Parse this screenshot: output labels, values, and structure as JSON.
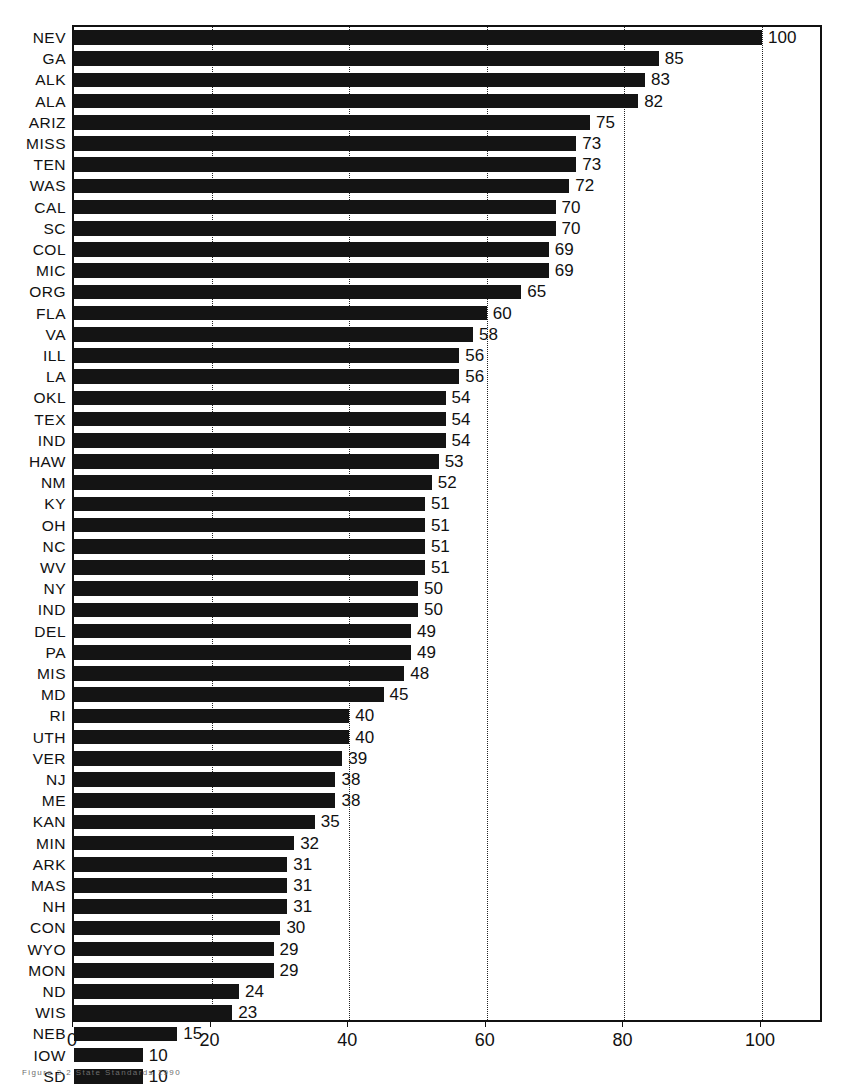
{
  "chart_data": {
    "type": "bar",
    "orientation": "horizontal",
    "title": "",
    "subtitle": "",
    "xlabel": "",
    "ylabel": "",
    "xlim": [
      0,
      110
    ],
    "xticks": [
      0,
      20,
      40,
      60,
      80,
      100
    ],
    "xtick_labels": [
      "0",
      "20",
      "40",
      "60",
      "80",
      "100"
    ],
    "gridlines": [
      20,
      40,
      60,
      80,
      100
    ],
    "grid": true,
    "grid_style": "dotted",
    "legend": null,
    "bar_color": "#141414",
    "categories": [
      "NEV",
      "GA",
      "ALK",
      "ALA",
      "ARIZ",
      "MISS",
      "TEN",
      "WAS",
      "CAL",
      "SC",
      "COL",
      "MIC",
      "ORG",
      "FLA",
      "VA",
      "ILL",
      "LA",
      "OKL",
      "TEX",
      "IND",
      "HAW",
      "NM",
      "KY",
      "OH",
      "NC",
      "WV",
      "NY",
      "IND",
      "DEL",
      "PA",
      "MIS",
      "MD",
      "RI",
      "UTH",
      "VER",
      "NJ",
      "ME",
      "KAN",
      "MIN",
      "ARK",
      "MAS",
      "NH",
      "CON",
      "WYO",
      "MON",
      "ND",
      "WIS",
      "NEB",
      "IOW",
      "SD"
    ],
    "values": [
      100,
      85,
      83,
      82,
      75,
      73,
      73,
      72,
      70,
      70,
      69,
      69,
      65,
      60,
      58,
      56,
      56,
      54,
      54,
      54,
      53,
      52,
      51,
      51,
      51,
      51,
      50,
      50,
      49,
      49,
      48,
      45,
      40,
      40,
      39,
      38,
      38,
      35,
      32,
      31,
      31,
      31,
      30,
      29,
      29,
      24,
      23,
      15,
      10,
      10
    ],
    "value_labels": [
      "100",
      "85",
      "83",
      "82",
      "75",
      "73",
      "73",
      "72",
      "70",
      "70",
      "69",
      "69",
      "65",
      "60",
      "58",
      "56",
      "56",
      "54",
      "54",
      "54",
      "53",
      "52",
      "51",
      "51",
      "51",
      "51",
      "50",
      "50",
      "49",
      "49",
      "48",
      "45",
      "40",
      "40",
      "39",
      "38",
      "38",
      "35",
      "32",
      "31",
      "31",
      "31",
      "30",
      "29",
      "29",
      "24",
      "23",
      "15",
      "10",
      "10"
    ]
  },
  "caption": {
    "text": "Figure 2.2   State Standards 1990"
  }
}
